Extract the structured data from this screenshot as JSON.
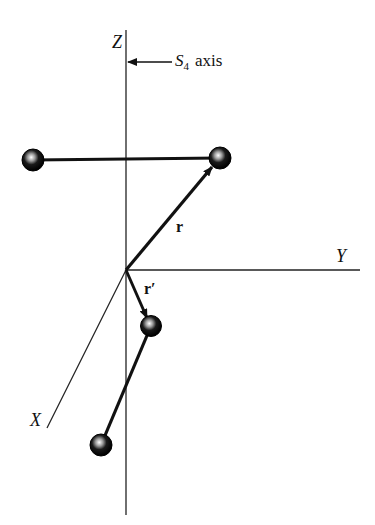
{
  "diagram": {
    "type": "molecular-symmetry-diagram",
    "axes": {
      "z_label": "Z",
      "y_label": "Y",
      "x_label": "X"
    },
    "annotation": {
      "symbol": "S",
      "subscript": "4",
      "text": "axis"
    },
    "vectors": {
      "r_label": "r",
      "r_prime_label": "r′"
    },
    "atoms": [
      {
        "name": "upper-left-atom",
        "x": 33,
        "y": 160
      },
      {
        "name": "upper-right-atom",
        "x": 220,
        "y": 158
      },
      {
        "name": "middle-atom",
        "x": 151,
        "y": 326
      },
      {
        "name": "lower-atom",
        "x": 101,
        "y": 445
      }
    ],
    "colors": {
      "ink": "#111111",
      "background": "#ffffff"
    }
  }
}
